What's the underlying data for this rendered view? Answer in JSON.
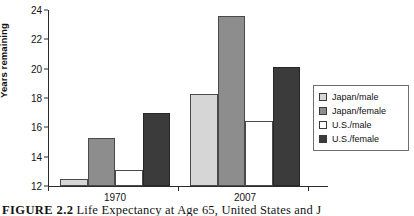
{
  "chart_data": {
    "type": "bar",
    "title": "",
    "xlabel": "",
    "ylabel": "Years remaining",
    "categories": [
      "1970",
      "2007"
    ],
    "ylim": [
      12,
      24
    ],
    "yticks": [
      12,
      14,
      16,
      18,
      20,
      22,
      24
    ],
    "grid": false,
    "legend_position": "right",
    "series": [
      {
        "name": "Japan/male",
        "color": "#d6d6d6",
        "values": [
          12.5,
          18.3
        ]
      },
      {
        "name": "Japan/female",
        "color": "#8d8d8d",
        "values": [
          15.3,
          23.6
        ]
      },
      {
        "name": "U.S./male",
        "color": "#ffffff",
        "values": [
          13.1,
          16.4
        ]
      },
      {
        "name": "U.S./female",
        "color": "#3b3b3b",
        "values": [
          17.0,
          20.1
        ]
      }
    ]
  },
  "axis": {
    "y_title": "Years remaining",
    "y_tick_labels": [
      "24",
      "22",
      "20",
      "18",
      "16",
      "14",
      "12"
    ],
    "x_tick_labels": [
      "1970",
      "2007"
    ]
  },
  "legend": {
    "items": [
      {
        "label": "Japan/male"
      },
      {
        "label": "Japan/female"
      },
      {
        "label": "U.S./male"
      },
      {
        "label": "U.S./female"
      }
    ]
  },
  "caption": {
    "figure_number": "FIGURE 2.2",
    "text": "Life Expectancy at Age 65, United States and J"
  }
}
